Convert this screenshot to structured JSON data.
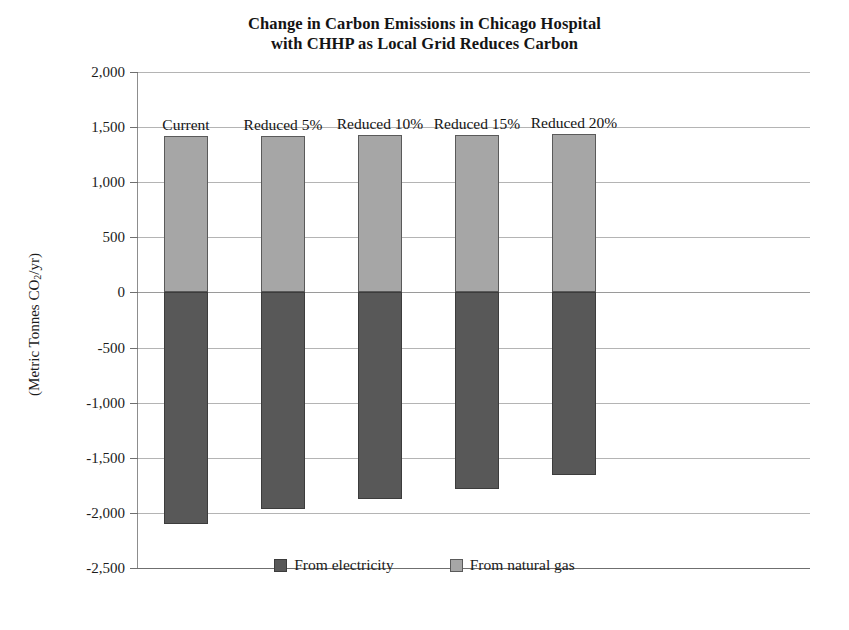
{
  "chart_data": {
    "type": "bar",
    "title": "Change in Carbon Emissions in Chicago Hospital with CHHP as Local Grid Reduces Carbon",
    "title_line1": "Change in Carbon Emissions in Chicago Hospital",
    "title_line2": "with CHHP as Local Grid Reduces Carbon",
    "xlabel": "",
    "ylabel": "(Metric Tonnes CO2/yr)",
    "ylabel_prefix": "(Metric Tonnes CO",
    "ylabel_sub": "2",
    "ylabel_suffix": "/yr)",
    "ylim": [
      -2500,
      2000
    ],
    "ytick_step": 500,
    "ytick_labels": [
      "2,000",
      "1,500",
      "1,000",
      "500",
      "0",
      "-500",
      "-1,000",
      "-1,500",
      "-2,000",
      "-2,500"
    ],
    "ytick_values": [
      2000,
      1500,
      1000,
      500,
      0,
      -500,
      -1000,
      -1500,
      -2000,
      -2500
    ],
    "grid": true,
    "stacked": true,
    "legend_position": "bottom",
    "categories": [
      "Current",
      "Reduced 5%",
      "Reduced 10%",
      "Reduced 15%",
      "Reduced 20%"
    ],
    "series": [
      {
        "name": "From electricity",
        "color": "#585858",
        "values": [
          -2100,
          -1965,
          -1875,
          -1780,
          -1660
        ]
      },
      {
        "name": "From natural gas",
        "color": "#a6a6a6",
        "values": [
          1415,
          1420,
          1425,
          1430,
          1440
        ]
      }
    ]
  },
  "legend": {
    "items": [
      {
        "label": "From electricity",
        "color": "#585858"
      },
      {
        "label": "From natural gas",
        "color": "#a6a6a6"
      }
    ]
  },
  "colors": {
    "electricity": "#585858",
    "natural_gas": "#a6a6a6",
    "gridline": "#b4b4b4",
    "axis": "#6f6f6f",
    "text": "#1b1b1b"
  }
}
